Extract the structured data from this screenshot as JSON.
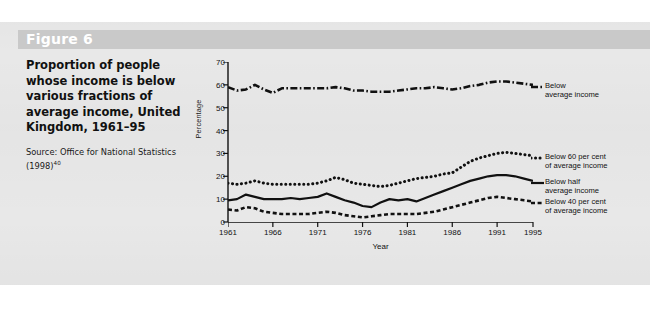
{
  "figure": {
    "banner_label": "Figure 6",
    "title": "Proportion of people whose income is below various fractions of average income, United Kingdom, 1961–95",
    "source_text": "Source: Office for National Statistics (1998)",
    "source_superscript": "40"
  },
  "colors": {
    "page_background": "#ffffff",
    "panel_background": "#e8e8e8",
    "banner_background": "#c9c9c9",
    "banner_text": "#ffffff",
    "ink": "#111111"
  },
  "chart_data": {
    "type": "line",
    "title": "Proportion of people whose income is below various fractions of average income, United Kingdom, 1961–95",
    "xlabel": "Year",
    "ylabel": "Percentage",
    "ylim": [
      0,
      70
    ],
    "yticks": [
      0,
      10,
      20,
      30,
      40,
      50,
      60,
      70
    ],
    "xlim": [
      1961,
      1995
    ],
    "xticks": [
      1961,
      1966,
      1971,
      1976,
      1981,
      1986,
      1991,
      1995
    ],
    "grid": false,
    "legend_position": "right",
    "x": [
      1961,
      1962,
      1963,
      1964,
      1965,
      1966,
      1967,
      1968,
      1969,
      1970,
      1971,
      1972,
      1973,
      1974,
      1975,
      1976,
      1977,
      1978,
      1979,
      1980,
      1981,
      1982,
      1983,
      1984,
      1985,
      1986,
      1987,
      1988,
      1989,
      1990,
      1991,
      1992,
      1993,
      1994,
      1995
    ],
    "series": [
      {
        "name": "Below average income",
        "legend_label": "Below average income",
        "style": "dash-dot",
        "values": [
          59,
          57.5,
          58,
          60,
          58,
          56.5,
          58.5,
          58.5,
          58.5,
          58.5,
          58.5,
          58.5,
          59,
          58.5,
          57.5,
          57.5,
          57,
          57,
          57,
          57.5,
          58,
          58.5,
          58.5,
          59,
          58.5,
          58,
          58.5,
          59.5,
          60,
          61,
          61.5,
          61.5,
          61,
          60.5,
          60
        ]
      },
      {
        "name": "Below 60 per cent of average income",
        "legend_label": "Below 60 per cent of average income",
        "style": "dotted",
        "values": [
          17,
          16.5,
          17,
          18,
          17,
          16.5,
          16.5,
          16.5,
          16.5,
          16.5,
          17,
          18,
          19.5,
          18.5,
          17,
          16.5,
          16,
          15.5,
          16,
          17,
          18,
          19,
          19.5,
          20,
          21,
          21.5,
          24,
          26.5,
          28,
          29,
          30,
          30.5,
          30,
          29.5,
          29
        ]
      },
      {
        "name": "Below half average income",
        "legend_label": "Below half average income",
        "style": "solid",
        "values": [
          9.5,
          10,
          12,
          11,
          10,
          10,
          10,
          10.5,
          10,
          10.5,
          11,
          12.5,
          11,
          9.5,
          8.5,
          7,
          6.5,
          8.5,
          10,
          9.5,
          10,
          9,
          10.5,
          12,
          13.5,
          15,
          16.5,
          18,
          19,
          20,
          20.5,
          20.5,
          20,
          19,
          18
        ]
      },
      {
        "name": "Below 40 per cent of average income",
        "legend_label": "Below 40 per cent of average income",
        "style": "dashed",
        "values": [
          5.5,
          5,
          6.5,
          6,
          4.5,
          4,
          3.5,
          3.5,
          3.5,
          3.5,
          4,
          4.5,
          4,
          3,
          2.5,
          2,
          2.5,
          3,
          3.5,
          3.5,
          3.5,
          3.5,
          4,
          4.5,
          5.5,
          6.5,
          7.5,
          8.5,
          9.5,
          10.5,
          11,
          10.5,
          10,
          9.5,
          9
        ]
      }
    ],
    "legend_entries": [
      {
        "label_line1": "Below",
        "label_line2": "average income",
        "style": "dash-dot"
      },
      {
        "label_line1": "Below 60 per cent",
        "label_line2": "of average income",
        "style": "dotted"
      },
      {
        "label_line1": "Below half",
        "label_line2": "average income",
        "style": "solid"
      },
      {
        "label_line1": "Below 40 per cent",
        "label_line2": "of average income",
        "style": "dashed"
      }
    ]
  }
}
